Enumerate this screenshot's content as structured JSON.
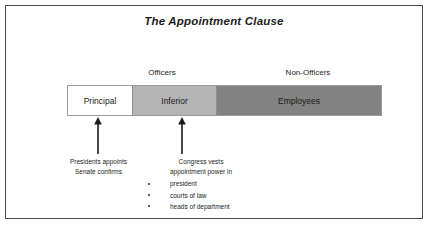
{
  "diagram": {
    "title": "The Appointment Clause",
    "group_labels": [
      {
        "name": "officers",
        "text": "Officers"
      },
      {
        "name": "non-officers",
        "text": "Non-Officers"
      }
    ],
    "bar_segments": [
      {
        "name": "principal",
        "label": "Principal",
        "color": "#ffffff"
      },
      {
        "name": "inferior",
        "label": "Inferior",
        "color": "#b4b4b4"
      },
      {
        "name": "employees",
        "label": "Employees",
        "color": "#828282"
      }
    ],
    "annotations": [
      {
        "name": "principal",
        "lines": [
          "Presidents appoints",
          "Senate confirms"
        ],
        "bullets": []
      },
      {
        "name": "inferior",
        "lines": [
          "Congress vests",
          "appointment power in"
        ],
        "bullets": [
          "president",
          "courts of law",
          "heads of department"
        ]
      }
    ],
    "arrows": [
      {
        "name": "principal",
        "direction": "up"
      },
      {
        "name": "inferior",
        "direction": "up"
      }
    ],
    "colors": {
      "frame_border": "#4a4a4a",
      "segment_border": "#9b9b9b",
      "arrow": "#1a1a1a",
      "text": "#1c1c1c",
      "background": "#ffffff"
    }
  }
}
